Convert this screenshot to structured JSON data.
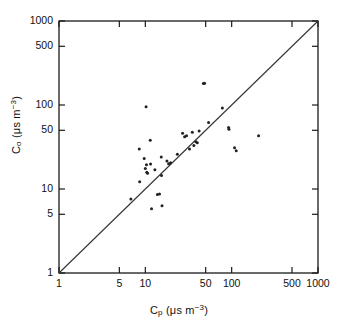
{
  "chart_data": {
    "type": "scatter",
    "title": "",
    "xlabel": "C_p (μs m−3)",
    "ylabel": "C_o (μs m−3)",
    "xscale": "log",
    "yscale": "log",
    "xlim": [
      1,
      1000
    ],
    "ylim": [
      1,
      1000
    ],
    "grid": false,
    "legend": null,
    "xticks": [
      1,
      5,
      10,
      50,
      100,
      500,
      1000
    ],
    "xtick_labels": [
      "1",
      "5",
      "10",
      "50",
      "100",
      "500",
      "1000"
    ],
    "yticks": [
      1,
      5,
      10,
      50,
      100,
      500,
      1000
    ],
    "ytick_labels": [
      "1",
      "5",
      "10",
      "50",
      "100",
      "500",
      "1000"
    ],
    "reference_line": {
      "label": "1:1 line",
      "from": [
        1,
        1
      ],
      "to": [
        1000,
        1000
      ],
      "color": "#333333"
    },
    "marker": "dot",
    "marker_color": "#222222",
    "points": [
      {
        "x": 6.8,
        "y": 7.6
      },
      {
        "x": 8.5,
        "y": 30.0
      },
      {
        "x": 8.6,
        "y": 12.2
      },
      {
        "x": 9.7,
        "y": 23.0
      },
      {
        "x": 10.0,
        "y": 17.5
      },
      {
        "x": 10.2,
        "y": 95.0
      },
      {
        "x": 10.3,
        "y": 19.5
      },
      {
        "x": 10.4,
        "y": 15.8
      },
      {
        "x": 10.6,
        "y": 15.4
      },
      {
        "x": 11.4,
        "y": 38.0
      },
      {
        "x": 11.5,
        "y": 19.8
      },
      {
        "x": 11.8,
        "y": 5.8
      },
      {
        "x": 12.9,
        "y": 17.0
      },
      {
        "x": 13.8,
        "y": 8.6
      },
      {
        "x": 14.6,
        "y": 8.7
      },
      {
        "x": 15.3,
        "y": 24.0
      },
      {
        "x": 15.4,
        "y": 14.5
      },
      {
        "x": 15.6,
        "y": 6.3
      },
      {
        "x": 17.8,
        "y": 21.5
      },
      {
        "x": 18.6,
        "y": 20.0
      },
      {
        "x": 19.6,
        "y": 20.5
      },
      {
        "x": 23.5,
        "y": 26.0
      },
      {
        "x": 27.0,
        "y": 46.0
      },
      {
        "x": 28.5,
        "y": 42.0
      },
      {
        "x": 30.0,
        "y": 43.0
      },
      {
        "x": 32.5,
        "y": 30.0
      },
      {
        "x": 35.0,
        "y": 47.5
      },
      {
        "x": 36.5,
        "y": 33.0
      },
      {
        "x": 38.5,
        "y": 36.5
      },
      {
        "x": 40.0,
        "y": 35.5
      },
      {
        "x": 42.0,
        "y": 49.0
      },
      {
        "x": 47.0,
        "y": 180.0
      },
      {
        "x": 48.5,
        "y": 182.0
      },
      {
        "x": 54.0,
        "y": 62.0
      },
      {
        "x": 78.0,
        "y": 92.0
      },
      {
        "x": 92.0,
        "y": 54.0
      },
      {
        "x": 93.0,
        "y": 51.5
      },
      {
        "x": 108.0,
        "y": 31.0
      },
      {
        "x": 113.0,
        "y": 28.5
      },
      {
        "x": 205.0,
        "y": 43.0
      }
    ]
  },
  "axes": {
    "x_label_main": "C",
    "x_label_sub": "p",
    "x_label_units_open": "(",
    "x_label_units": "μs m",
    "x_label_units_exp": "−3",
    "x_label_units_close": ")",
    "y_label_main": "C",
    "y_label_sub": "o",
    "y_label_units_open": "(",
    "y_label_units": "μs m",
    "y_label_units_exp": "−3",
    "y_label_units_close": ")"
  },
  "colors": {
    "frame": "#1a1a1a",
    "text": "#111111",
    "marker": "#222222",
    "line": "#333333",
    "background": "#ffffff"
  }
}
